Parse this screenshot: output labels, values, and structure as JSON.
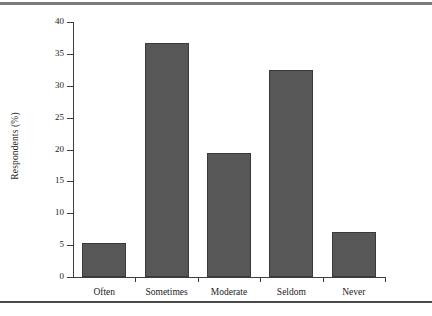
{
  "figure": {
    "y_axis_title": "Respondents (%)",
    "bar_color": "#575757",
    "bar_edge_color": "#3a3a3a",
    "axis_color": "#3d3d3d",
    "rule_color_top": "#7a7a7a",
    "rule_color_bottom": "#4a4a4a"
  },
  "chart_data": {
    "type": "bar",
    "title": "",
    "subtitle": "",
    "xlabel": "",
    "ylabel": "Respondents (%)",
    "categories": [
      "Often",
      "Sometimes",
      "Moderate",
      "Seldom",
      "Never"
    ],
    "values": [
      5.4,
      36.7,
      19.5,
      32.5,
      7.0
    ],
    "ylim": [
      0,
      40
    ],
    "yticks": [
      0,
      5,
      10,
      15,
      20,
      25,
      30,
      35,
      40
    ],
    "ytick_labels": [
      "0",
      "5",
      "10",
      "15",
      "20",
      "25",
      "30",
      "35",
      "40"
    ],
    "grid": false,
    "legend": null,
    "legend_position": "none",
    "annotations": []
  }
}
